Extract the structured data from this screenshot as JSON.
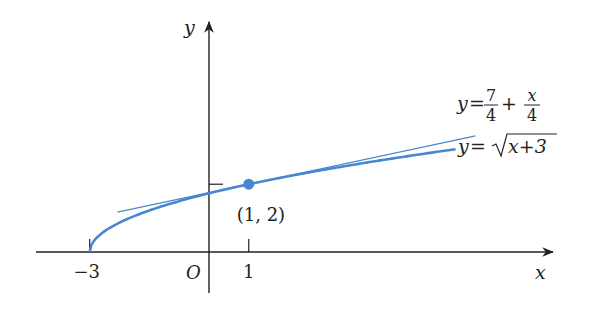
{
  "chart_data": {
    "type": "line",
    "title": "",
    "xlabel": "x",
    "ylabel": "y",
    "origin_label": "O",
    "xlim": [
      -4.5,
      8.7
    ],
    "ylim": [
      -1.3,
      6.7
    ],
    "x_ticks": [
      {
        "value": -3,
        "label": "−3"
      },
      {
        "value": 1,
        "label": "1"
      }
    ],
    "y_ticks": [
      {
        "value": 2,
        "label": ""
      }
    ],
    "series": [
      {
        "name": "curve",
        "equation": "y = sqrt(x+3)",
        "label_parts": {
          "lhs": "y",
          "eq": "=",
          "radicand": "x+3"
        },
        "domain": [
          -3,
          6.2
        ],
        "color": "#4a86cf",
        "role": "curve"
      },
      {
        "name": "tangent",
        "equation": "y = 7/4 + x/4",
        "label_parts": {
          "lhs": "y",
          "eq": "=",
          "num1": "7",
          "den1": "4",
          "plus": "+",
          "num2": "x",
          "den2": "4"
        },
        "domain": [
          -2.3,
          6.7
        ],
        "color": "#4a86cf",
        "role": "tangent-line"
      }
    ],
    "points": [
      {
        "x": 1,
        "y": 2,
        "label": "(1, 2)",
        "color": "#4a86cf"
      }
    ],
    "grid": false,
    "legend": "none"
  }
}
